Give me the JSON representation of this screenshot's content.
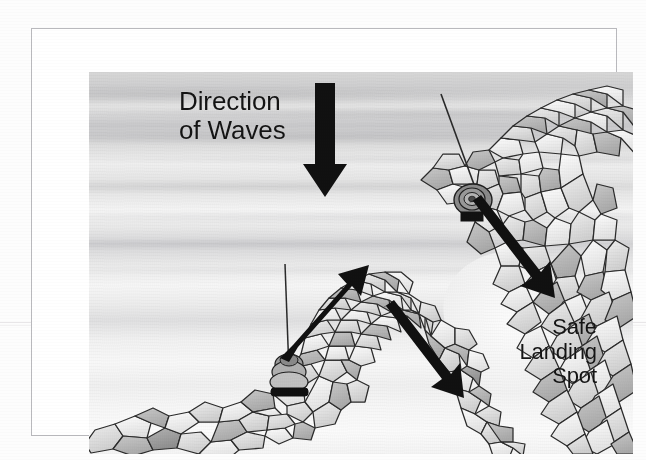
{
  "document": {
    "kind": "scanned-illustration",
    "subject": "harbour entrance with rock breakwaters"
  },
  "frame": {
    "border_color": "#b9b9bd"
  },
  "illustration": {
    "background": {
      "name": "water-wash",
      "description": "grey watercolour wash water surface with horizontal wave bands",
      "colors": [
        "#d8d8d8",
        "#e3e3e3",
        "#f4f4f4",
        "#fbfbfb"
      ]
    },
    "labels": [
      {
        "id": "direction-of-waves",
        "text": "Direction\nof Waves",
        "align": "left",
        "color": "#141414",
        "font_size_px": 26
      },
      {
        "id": "safe-landing-spot",
        "text": "Safe\nLanding\nSpot",
        "align": "right",
        "color": "#141414",
        "font_size_px": 22
      }
    ],
    "arrows": [
      {
        "id": "wave-direction-arrow",
        "name": "down-arrow",
        "direction": "down",
        "color": "#111111",
        "from": [
          293,
          11
        ],
        "to": [
          293,
          125
        ]
      },
      {
        "id": "swell-arrow-left-jetty",
        "name": "up-right-arrow",
        "direction": "up-right",
        "color": "#111111",
        "from": [
          196,
          280
        ],
        "to": [
          270,
          196
        ]
      },
      {
        "id": "swell-arrow-channel",
        "name": "down-right-arrow",
        "direction": "down-right",
        "color": "#111111",
        "from": [
          296,
          242
        ],
        "to": [
          370,
          340
        ]
      },
      {
        "id": "swell-arrow-right-jetty",
        "name": "down-right-arrow",
        "direction": "down-right",
        "color": "#111111",
        "from": [
          384,
          137
        ],
        "to": [
          467,
          236
        ]
      }
    ],
    "markers": [
      {
        "id": "marker-left-jetty",
        "name": "navigation-marker",
        "description": "channel marker buoy with mast on left breakwater",
        "x": 192,
        "y": 296
      },
      {
        "id": "marker-right-jetty",
        "name": "navigation-marker",
        "description": "channel marker buoy with mast on right breakwater",
        "x": 380,
        "y": 115
      }
    ],
    "structures": [
      {
        "id": "left-breakwater",
        "name": "rock-breakwater",
        "description": "rubble-mound rock jetty rising from lower-left to a peak"
      },
      {
        "id": "right-breakwater",
        "name": "rock-breakwater",
        "description": "curved rubble-mound rock jetty enclosing the landing area"
      },
      {
        "id": "landing-area",
        "name": "sheltered-water",
        "description": "calm sheltered pocket of water inside the curved jetty"
      }
    ]
  }
}
